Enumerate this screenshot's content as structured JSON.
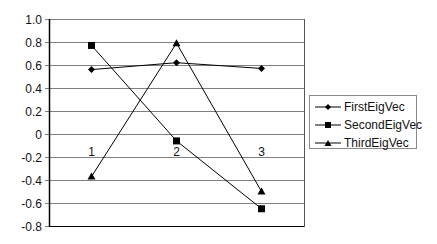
{
  "chart_data": {
    "type": "line",
    "title": "",
    "xlabel": "",
    "ylabel": "",
    "categories": [
      "1",
      "2",
      "3"
    ],
    "series": [
      {
        "name": "FirstEigVec",
        "marker": "diamond",
        "values": [
          0.56,
          0.62,
          0.57
        ]
      },
      {
        "name": "SecondEigVec",
        "marker": "square",
        "values": [
          0.77,
          -0.06,
          -0.65
        ]
      },
      {
        "name": "ThirdEigVec",
        "marker": "triangle",
        "values": [
          -0.37,
          0.79,
          -0.5
        ]
      }
    ],
    "ylim": [
      -0.8,
      1.0
    ],
    "yticks": [
      "1.0",
      "0.8",
      "0.6",
      "0.4",
      "0.2",
      "0",
      "-0.2",
      "-0.4",
      "-0.6",
      "-0.8"
    ],
    "grid": true,
    "legend_position": "right",
    "category_labels_at_y": 0
  },
  "legend": {
    "items": [
      {
        "label": "FirstEigVec"
      },
      {
        "label": "SecondEigVec"
      },
      {
        "label": "ThirdEigVec"
      }
    ]
  },
  "colors": {
    "line": "#000000",
    "grid": "#808080",
    "axis": "#000000"
  }
}
